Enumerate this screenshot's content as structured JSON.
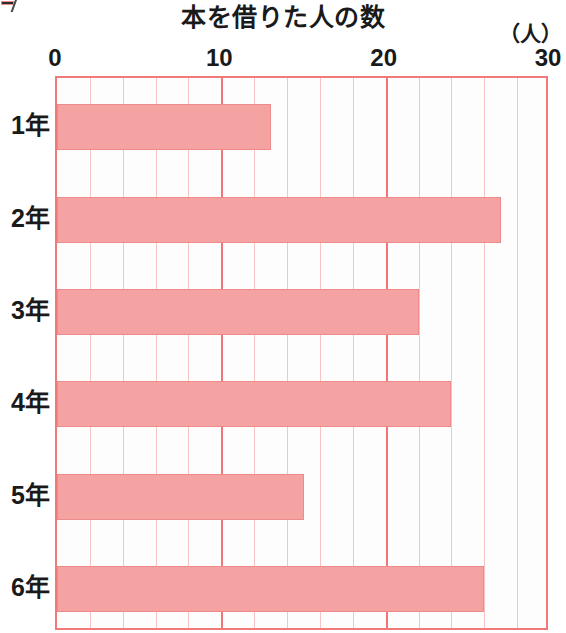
{
  "corner_mark": {
    "name": "cropped-corner-artifact"
  },
  "chart_data": {
    "type": "bar",
    "orientation": "horizontal",
    "title": "本を借りた人の数",
    "unit_label": "（人）",
    "xlabel": "",
    "ylabel": "",
    "categories": [
      "1年",
      "2年",
      "3年",
      "4年",
      "5年",
      "6年"
    ],
    "values": [
      13,
      27,
      22,
      24,
      15,
      26
    ],
    "xlim": [
      0,
      30
    ],
    "x_major_ticks": [
      0,
      10,
      20,
      30
    ],
    "x_major_tick_labels": [
      "0",
      "10",
      "20",
      "30"
    ],
    "x_minor_tick_step": 2,
    "grid": true,
    "legend": false,
    "bar_color": "#f4a2a2",
    "bar_border_color": "#ef8a8a",
    "grid_major_color": "#ef7676",
    "grid_minor_color": "#f6c4c4",
    "frame_color": "#f07a7a",
    "series": [
      {
        "name": "本を借りた人の数",
        "values": [
          13,
          27,
          22,
          24,
          15,
          26
        ]
      }
    ],
    "points": [
      {
        "category": "1年",
        "value": 13
      },
      {
        "category": "2年",
        "value": 27
      },
      {
        "category": "3年",
        "value": 22
      },
      {
        "category": "4年",
        "value": 24
      },
      {
        "category": "5年",
        "value": 15
      },
      {
        "category": "6年",
        "value": 26
      }
    ]
  }
}
